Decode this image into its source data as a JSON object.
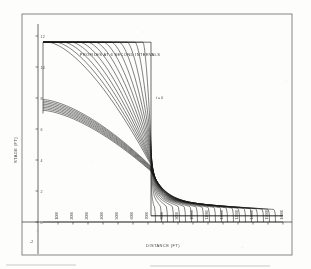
{
  "figure": {
    "title": "PROFILES AT 6 SECOND INTERVALS",
    "annotation": "t = 0",
    "xlabel": "DISTANCE (FT)",
    "ylabel": "STAGE (FT)",
    "ink_color": "#1a1a1a",
    "paper_color": "#fdfdfc"
  },
  "chart_data": {
    "type": "line",
    "title": "PROFILES AT 6 SECOND INTERVALS",
    "xlabel": "DISTANCE (FT)",
    "ylabel": "STAGE (FT)",
    "annotations": [
      {
        "text": "t = 0",
        "x": 7200,
        "y": 8.0
      }
    ],
    "xlim": [
      0,
      16000
    ],
    "ylim": [
      -2,
      13
    ],
    "grid": false,
    "legend": null,
    "ytick_labels": [
      "12",
      "10",
      "8",
      "6",
      "4",
      "2",
      "0",
      "-2"
    ],
    "ytick_values": [
      12,
      10,
      8,
      6,
      4,
      2,
      0,
      -2
    ],
    "xtick_labels": [
      "1000",
      "2000",
      "3000",
      "4000",
      "5000",
      "6000",
      "7000",
      "8000",
      "9000",
      "10000",
      "11000",
      "12000",
      "13000",
      "14000",
      "15000",
      "16000"
    ],
    "xtick_values": [
      1000,
      2000,
      3000,
      4000,
      5000,
      6000,
      7000,
      8000,
      9000,
      10000,
      11000,
      12000,
      13000,
      14000,
      15000,
      16000
    ],
    "time_interval_seconds": 6,
    "n_profiles": 22,
    "initial_profile": {
      "name": "t = 0",
      "description": "initial step: upstream stage 11.6 ft held to the dam at x = 7200 ft, then drops vertically to downstream stage 0.4 ft",
      "x": [
        0,
        7200,
        7200,
        16000
      ],
      "y": [
        11.6,
        11.6,
        0.4,
        0.4
      ]
    },
    "series": [
      {
        "name": "t = 0 s",
        "upstream_head": 11.6,
        "front_x": 7200,
        "downstream_depth": 0.4
      },
      {
        "name": "t = 6 s",
        "upstream_head": 11.3,
        "front_x": 7500,
        "downstream_depth": 0.4
      },
      {
        "name": "t = 12 s",
        "upstream_head": 11.0,
        "front_x": 7900,
        "downstream_depth": 0.4
      },
      {
        "name": "t = 18 s",
        "upstream_head": 10.7,
        "front_x": 8300,
        "downstream_depth": 0.4
      },
      {
        "name": "t = 24 s",
        "upstream_head": 10.4,
        "front_x": 8700,
        "downstream_depth": 0.4
      },
      {
        "name": "t = 30 s",
        "upstream_head": 10.1,
        "front_x": 9100,
        "downstream_depth": 0.4
      },
      {
        "name": "t = 36 s",
        "upstream_head": 9.8,
        "front_x": 9500,
        "downstream_depth": 0.4
      },
      {
        "name": "t = 42 s",
        "upstream_head": 9.5,
        "front_x": 9900,
        "downstream_depth": 0.4
      },
      {
        "name": "t = 48 s",
        "upstream_head": 9.2,
        "front_x": 10300,
        "downstream_depth": 0.4
      },
      {
        "name": "t = 54 s",
        "upstream_head": 8.9,
        "front_x": 10700,
        "downstream_depth": 0.4
      },
      {
        "name": "t = 60 s",
        "upstream_head": 8.7,
        "front_x": 11100,
        "downstream_depth": 0.4
      },
      {
        "name": "t = 66 s",
        "upstream_head": 8.5,
        "front_x": 11500,
        "downstream_depth": 0.4
      },
      {
        "name": "t = 72 s",
        "upstream_head": 8.3,
        "front_x": 11900,
        "downstream_depth": 0.4
      },
      {
        "name": "t = 78 s",
        "upstream_head": 8.1,
        "front_x": 12300,
        "downstream_depth": 0.4
      },
      {
        "name": "t = 84 s",
        "upstream_head": 7.9,
        "front_x": 12700,
        "downstream_depth": 0.4
      },
      {
        "name": "t = 90 s",
        "upstream_head": 7.8,
        "front_x": 13100,
        "downstream_depth": 0.4
      },
      {
        "name": "t = 96 s",
        "upstream_head": 7.7,
        "front_x": 13500,
        "downstream_depth": 0.4
      },
      {
        "name": "t = 102 s",
        "upstream_head": 7.6,
        "front_x": 13900,
        "downstream_depth": 0.4
      },
      {
        "name": "t = 108 s",
        "upstream_head": 7.5,
        "front_x": 14300,
        "downstream_depth": 0.4
      },
      {
        "name": "t = 114 s",
        "upstream_head": 7.4,
        "front_x": 14700,
        "downstream_depth": 0.4
      },
      {
        "name": "t = 120 s",
        "upstream_head": 7.3,
        "front_x": 15100,
        "downstream_depth": 0.4
      },
      {
        "name": "t = 126 s",
        "upstream_head": 7.2,
        "front_x": 15500,
        "downstream_depth": 0.4
      }
    ]
  }
}
